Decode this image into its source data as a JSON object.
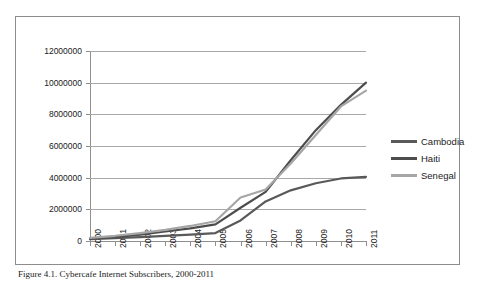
{
  "figure": {
    "caption": "Figure 4.1. Cybercafe Internet Subscribers, 2000-2011"
  },
  "legend": {
    "position": "right",
    "entries": [
      {
        "label": "Cambodia",
        "color": "#595959"
      },
      {
        "label": "Haiti",
        "color": "#4d4d4d"
      },
      {
        "label": "Senegal",
        "color": "#a6a6a6"
      }
    ]
  },
  "axes": {
    "y_tick_labels": [
      "12000000",
      "10000000",
      "8000000",
      "6000000",
      "4000000",
      "2000000",
      "0"
    ],
    "x_tick_labels": [
      "2000",
      "2001",
      "2002",
      "2003",
      "2004",
      "2005",
      "2006",
      "2007",
      "2008",
      "2009",
      "2010",
      "2011"
    ]
  },
  "chart_data": {
    "type": "line",
    "title": "",
    "xlabel": "",
    "ylabel": "",
    "grid": true,
    "legend_position": "right",
    "x": [
      "2000",
      "2001",
      "2002",
      "2003",
      "2004",
      "2005",
      "2006",
      "2007",
      "2008",
      "2009",
      "2010",
      "2011"
    ],
    "ylim": [
      0,
      12000000
    ],
    "ytick_step": 2000000,
    "series": [
      {
        "name": "Cambodia",
        "color": "#595959",
        "values": [
          120000,
          180000,
          250000,
          330000,
          400000,
          500000,
          1300000,
          2500000,
          3200000,
          3650000,
          3950000,
          4050000
        ]
      },
      {
        "name": "Haiti",
        "color": "#4d4d4d",
        "values": [
          150000,
          250000,
          400000,
          600000,
          800000,
          1050000,
          2100000,
          3100000,
          5100000,
          7000000,
          8600000,
          10000000
        ]
      },
      {
        "name": "Senegal",
        "color": "#a6a6a6",
        "values": [
          200000,
          330000,
          500000,
          700000,
          950000,
          1250000,
          2750000,
          3250000,
          4900000,
          6700000,
          8500000,
          9500000
        ]
      }
    ]
  }
}
